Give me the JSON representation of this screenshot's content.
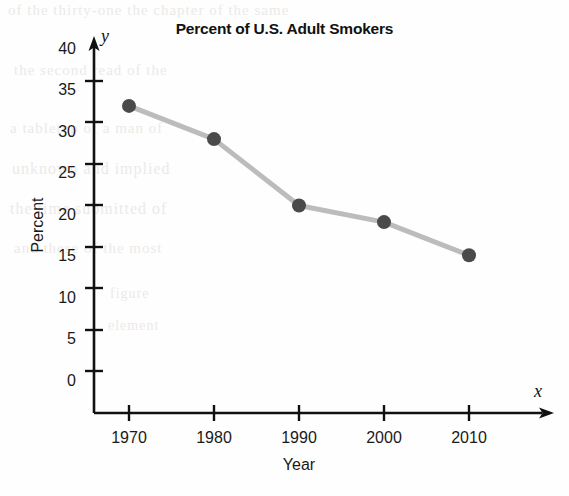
{
  "chart_data": {
    "type": "line",
    "title": "Percent of U.S. Adult Smokers",
    "xlabel": "Year",
    "ylabel": "Percent",
    "x_axis_letter": "x",
    "y_axis_letter": "y",
    "categories": [
      1970,
      1980,
      1990,
      2000,
      2010
    ],
    "x_tick_labels": [
      "1970",
      "1980",
      "1990",
      "2000",
      "2010"
    ],
    "values": [
      37,
      33,
      25,
      23,
      19
    ],
    "y_tick_labels": [
      "0",
      "5",
      "10",
      "15",
      "20",
      "25",
      "30",
      "35",
      "40"
    ],
    "y_ticks": [
      0,
      5,
      10,
      15,
      20,
      25,
      30,
      35,
      40
    ],
    "ylim": [
      0,
      43
    ],
    "xlim": [
      1965,
      2020
    ],
    "grid": false,
    "legend": null,
    "series": [
      {
        "name": "Percent of U.S. Adult Smokers",
        "values": [
          37,
          33,
          25,
          23,
          19
        ],
        "marker": "filled-circle",
        "marker_color": "#4a4a4a",
        "line_color": "#bcbcbc"
      }
    ],
    "annotations": []
  },
  "colors": {
    "marker": "#4a4a4a",
    "line": "#bcbcbc",
    "axis": "#111111",
    "text": "#1a1a1a",
    "background": "#fefefe"
  },
  "ghost_text": {
    "line1": "of the thirty-one the chapter of the same",
    "line2": "the second read of the",
    "line3": "a tabletop of a man of",
    "line4": "unknown and implied",
    "line5": "the time  submitted of",
    "line6": "and  these of the most",
    "line7": "figure",
    "line8": "element"
  }
}
